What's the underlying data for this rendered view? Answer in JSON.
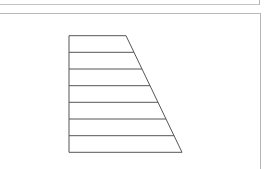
{
  "panels": {
    "top": {
      "visible": true
    },
    "main": {
      "visible": true
    }
  },
  "diagram": {
    "shape": "right-trapezoid",
    "stroke_color": "#555555",
    "fill_color": "#ffffff",
    "vertices": {
      "top_left": [
        69,
        35.7
      ],
      "top_right": [
        126,
        35.7
      ],
      "bottom_right": [
        182,
        152.3
      ],
      "bottom_left": [
        69,
        152.3
      ]
    },
    "strip_count": 7,
    "horizontal_lines_y": [
      35.7,
      52.3,
      69.0,
      85.7,
      102.3,
      119.0,
      135.7,
      152.3
    ]
  }
}
